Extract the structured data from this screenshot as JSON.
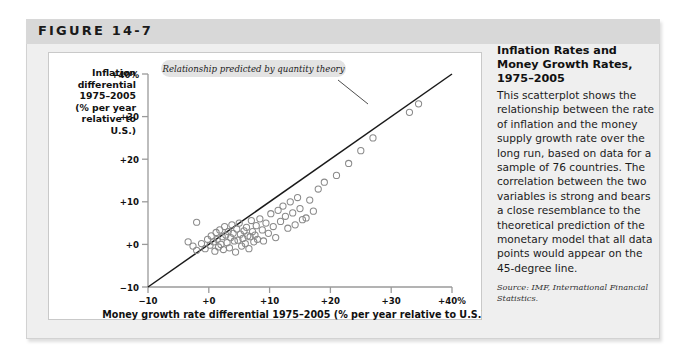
{
  "figure": {
    "label": "FIGURE 14-7"
  },
  "caption": {
    "title": "Inflation Rates and Money Growth Rates, 1975–2005",
    "body": "This scatterplot shows the relationship between the rate of inflation and the money supply growth rate over the long run, based on data for a sample of 76 countries. The correlation between the two variables is strong and bears a close resemblance to the theoretical prediction of the monetary model that all data points would appear on the 45-degree line.",
    "source": "Source: IMF, International Financial Statistics."
  },
  "chart_data": {
    "type": "scatter",
    "title": "",
    "xlabel": "Money growth rate differential 1975–2005 (% per year relative to U.S.)",
    "ylabel": "Inflation differential 1975–2005 (% per year relative to U.S.)",
    "xlim": [
      -10,
      40
    ],
    "ylim": [
      -10,
      40
    ],
    "xticks": [
      -10,
      0,
      10,
      20,
      30,
      40
    ],
    "xticklabels": [
      "−10",
      "+0",
      "+10",
      "+20",
      "+30",
      "+40%"
    ],
    "yticks": [
      -10,
      0,
      10,
      20,
      30,
      40
    ],
    "yticklabels": [
      "−10",
      "+0",
      "+10",
      "+20",
      "+30",
      "+40%"
    ],
    "grid": false,
    "legend": null,
    "annotations": [
      {
        "text": "Relationship predicted by quantity theory",
        "x": 9.5,
        "y": 37.0,
        "points_to_x": 24.5,
        "points_to_y": 26.0
      }
    ],
    "reference_line": {
      "name": "45-degree line (quantity theory prediction)",
      "from": [
        -10,
        -10
      ],
      "to": [
        40,
        40
      ],
      "color": "#1a1a1a"
    },
    "marker": {
      "style": "open-circle",
      "color": "#8a8a8a",
      "size": 3.1
    },
    "series": [
      {
        "name": "Countries",
        "n": 76,
        "points": [
          [
            -2.0,
            5.2
          ],
          [
            -3.4,
            0.6
          ],
          [
            -2.6,
            -0.4
          ],
          [
            -2.0,
            -1.4
          ],
          [
            -1.2,
            0.2
          ],
          [
            -0.6,
            -1.0
          ],
          [
            -0.2,
            1.2
          ],
          [
            0.2,
            -0.2
          ],
          [
            0.4,
            2.0
          ],
          [
            0.8,
            0.6
          ],
          [
            1.0,
            -1.6
          ],
          [
            1.2,
            2.8
          ],
          [
            1.4,
            1.2
          ],
          [
            1.6,
            -0.6
          ],
          [
            1.8,
            3.4
          ],
          [
            2.0,
            0.0
          ],
          [
            2.2,
            1.8
          ],
          [
            2.4,
            -1.2
          ],
          [
            2.6,
            4.2
          ],
          [
            2.8,
            2.2
          ],
          [
            3.0,
            0.4
          ],
          [
            3.2,
            3.0
          ],
          [
            3.4,
            -0.8
          ],
          [
            3.6,
            1.6
          ],
          [
            3.8,
            4.6
          ],
          [
            4.0,
            2.6
          ],
          [
            4.2,
            0.8
          ],
          [
            4.4,
            -1.8
          ],
          [
            4.6,
            3.6
          ],
          [
            4.8,
            1.0
          ],
          [
            5.0,
            5.0
          ],
          [
            5.2,
            2.4
          ],
          [
            5.4,
            -0.4
          ],
          [
            5.6,
            1.4
          ],
          [
            5.8,
            3.2
          ],
          [
            6.0,
            0.2
          ],
          [
            6.2,
            4.0
          ],
          [
            6.4,
            2.0
          ],
          [
            6.6,
            -1.0
          ],
          [
            6.8,
            1.8
          ],
          [
            7.0,
            5.6
          ],
          [
            7.2,
            3.0
          ],
          [
            7.4,
            0.6
          ],
          [
            7.6,
            2.2
          ],
          [
            7.8,
            4.4
          ],
          [
            8.0,
            1.2
          ],
          [
            8.4,
            6.0
          ],
          [
            8.8,
            3.4
          ],
          [
            9.0,
            0.8
          ],
          [
            9.4,
            5.0
          ],
          [
            9.8,
            2.6
          ],
          [
            10.2,
            7.2
          ],
          [
            10.6,
            4.2
          ],
          [
            11.0,
            1.6
          ],
          [
            11.4,
            8.0
          ],
          [
            11.8,
            5.4
          ],
          [
            12.2,
            9.0
          ],
          [
            12.6,
            6.6
          ],
          [
            13.0,
            3.8
          ],
          [
            13.4,
            10.0
          ],
          [
            13.8,
            7.4
          ],
          [
            14.2,
            4.6
          ],
          [
            14.6,
            11.0
          ],
          [
            15.0,
            8.4
          ],
          [
            15.4,
            5.8
          ],
          [
            16.0,
            6.2
          ],
          [
            16.6,
            10.4
          ],
          [
            17.2,
            7.8
          ],
          [
            18.0,
            13.0
          ],
          [
            19.0,
            14.6
          ],
          [
            21.0,
            16.2
          ],
          [
            23.0,
            19.0
          ],
          [
            25.0,
            22.0
          ],
          [
            27.0,
            25.0
          ],
          [
            33.0,
            31.0
          ],
          [
            34.5,
            33.0
          ]
        ]
      }
    ]
  }
}
